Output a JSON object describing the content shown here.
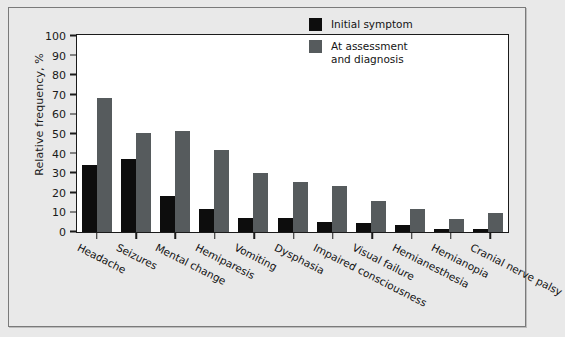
{
  "chart_data": {
    "type": "bar",
    "title": "",
    "xlabel": "",
    "ylabel": "Relative frequency, %",
    "ylim": [
      0,
      100
    ],
    "yticks": [
      100,
      90,
      80,
      70,
      60,
      50,
      40,
      30,
      20,
      10,
      0
    ],
    "grid": false,
    "legend_position": "top-right",
    "categories": [
      "Headache",
      "Seizures",
      "Mental change",
      "Hemiparesis",
      "Vomiting",
      "Dysphasia",
      "Impaired consciousness",
      "Visual failure",
      "Hemianesthesia",
      "Hemianopia",
      "Cranial nerve palsy"
    ],
    "series": [
      {
        "name": "Initial symptom",
        "color": "#0d0d0d",
        "values": [
          34,
          37.5,
          18.5,
          11.5,
          7,
          7,
          5,
          4.5,
          3.5,
          1.5,
          1.5
        ]
      },
      {
        "name": "At assessment and diagnosis",
        "color": "#565b5d",
        "values": [
          68.5,
          50.5,
          51.5,
          42,
          30,
          25.5,
          23.5,
          16,
          11.5,
          6.5,
          9.5
        ]
      }
    ]
  },
  "legend": {
    "items": [
      {
        "label": "Initial symptom",
        "label_line2": ""
      },
      {
        "label": "At assessment",
        "label_line2": "and diagnosis"
      }
    ]
  }
}
